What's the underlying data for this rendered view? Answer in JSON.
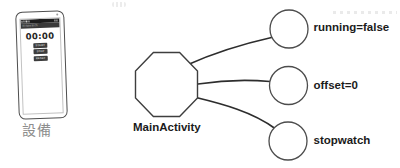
{
  "figure": {
    "background": "#ffffff",
    "ink_color": "#2d2d2d",
    "label_color": "#1b1b1b",
    "muted_label_color": "#8d8d8d"
  },
  "device": {
    "caption": "設備",
    "phone": {
      "app_title": "Stopwatch",
      "time_display": "00:00",
      "buttons": [
        {
          "label": "START"
        },
        {
          "label": "STOP"
        },
        {
          "label": "RESET"
        }
      ]
    }
  },
  "graph": {
    "main_node": {
      "label": "MainActivity",
      "shape": "octagon"
    },
    "state_nodes": [
      {
        "label": "running=false",
        "shape": "circle"
      },
      {
        "label": "offset=0",
        "shape": "circle"
      },
      {
        "label": "stopwatch",
        "shape": "circle"
      }
    ]
  },
  "icons": {
    "front_camera": "dot",
    "status_indicators": "dots"
  }
}
